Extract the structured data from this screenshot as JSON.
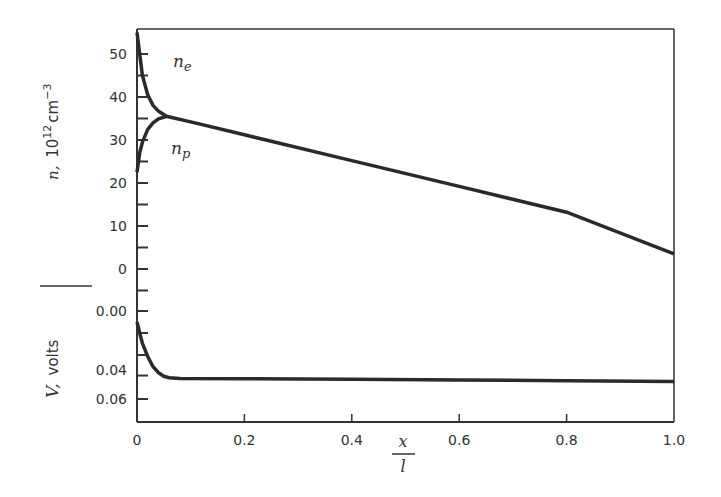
{
  "chart_data": [
    {
      "type": "line",
      "panel": "top",
      "ylabel": "n, 10^12 cm^-3",
      "ylabel_parts": {
        "var": "n,",
        "base": "10",
        "exp1": "12",
        "unit": "cm",
        "exp2": "−3"
      },
      "ylim": [
        0,
        55
      ],
      "yticks": [
        0,
        10,
        20,
        30,
        40,
        50
      ],
      "xlim": [
        0,
        1.0
      ],
      "series": [
        {
          "name": "n_e",
          "label_main": "n",
          "label_sub": "e",
          "x": [
            0.0,
            0.005,
            0.01,
            0.02,
            0.03,
            0.04,
            0.055,
            0.1,
            0.2,
            0.4,
            0.6,
            0.8,
            1.0
          ],
          "y": [
            55,
            50,
            45,
            40.5,
            38,
            36.7,
            35.5,
            34.2,
            31.2,
            25.2,
            19.2,
            13.2,
            3.5
          ]
        },
        {
          "name": "n_p",
          "label_main": "n",
          "label_sub": "p",
          "x": [
            0.0,
            0.005,
            0.01,
            0.02,
            0.03,
            0.04,
            0.055
          ],
          "y": [
            22.5,
            27,
            29.5,
            32.5,
            34,
            34.9,
            35.5
          ]
        }
      ],
      "grid": false,
      "legend": "inline labels"
    },
    {
      "type": "line",
      "panel": "bottom",
      "ylabel": "V, volts",
      "ylabel_parts": {
        "var": "V,",
        "unit": "volts"
      },
      "ylim": [
        0.07,
        -0.005
      ],
      "yticks": [
        "0.00",
        "0.04",
        "0.06"
      ],
      "ytick_values": [
        0.0,
        0.04,
        0.06
      ],
      "xlabel": "x / l",
      "xlabel_parts": {
        "num": "x",
        "den": "l"
      },
      "xticks": [
        "0",
        "0.2",
        "0.4",
        "0.6",
        "0.8",
        "1.0"
      ],
      "xlim": [
        0,
        1.0
      ],
      "series": [
        {
          "name": "V",
          "x": [
            0.0,
            0.005,
            0.01,
            0.02,
            0.03,
            0.04,
            0.05,
            0.06,
            0.08,
            0.2,
            0.4,
            0.6,
            0.8,
            1.0
          ],
          "y": [
            0.0075,
            0.015,
            0.022,
            0.031,
            0.038,
            0.042,
            0.0445,
            0.0455,
            0.046,
            0.0462,
            0.0465,
            0.047,
            0.0475,
            0.048
          ]
        }
      ],
      "grid": false
    }
  ]
}
